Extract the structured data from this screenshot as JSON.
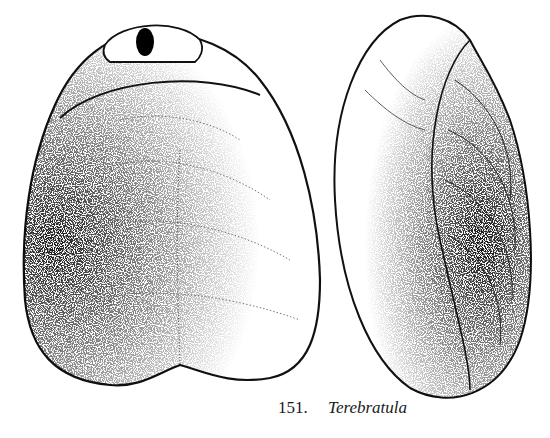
{
  "figure": {
    "views": [
      "dorsal view with pedicle opening",
      "side view"
    ],
    "caption": {
      "number": "151.",
      "name": "Terebratula"
    }
  }
}
